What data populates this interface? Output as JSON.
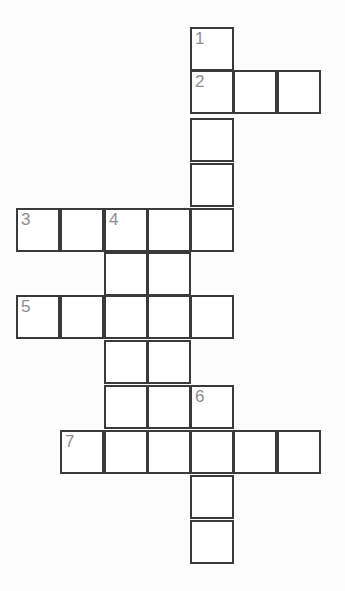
{
  "puzzle": {
    "type": "crossword-grid",
    "title": "Crossword puzzle grid",
    "background_color": "#fdfdfd",
    "cell_fill_color": "#ffffff",
    "cell_border_color": "#3a3a3a",
    "number_color": "#8d8d8d",
    "cell_size": 44,
    "columns": 7,
    "rows": 12,
    "clue_numbers": [
      "1",
      "2",
      "3",
      "4",
      "5",
      "6",
      "7"
    ],
    "cells": [
      {
        "name": "cell-c4-r0",
        "col": 4,
        "row": 0,
        "number": "1"
      },
      {
        "name": "cell-c4-r1",
        "col": 4,
        "row": 1,
        "number": "2"
      },
      {
        "name": "cell-c5-r1",
        "col": 5,
        "row": 1,
        "number": ""
      },
      {
        "name": "cell-c6-r1",
        "col": 6,
        "row": 1,
        "number": ""
      },
      {
        "name": "cell-c4-r2",
        "col": 4,
        "row": 2,
        "number": ""
      },
      {
        "name": "cell-c4-r3",
        "col": 4,
        "row": 3,
        "number": ""
      },
      {
        "name": "cell-c0-r4",
        "col": 0,
        "row": 4,
        "number": "3"
      },
      {
        "name": "cell-c1-r4",
        "col": 1,
        "row": 4,
        "number": ""
      },
      {
        "name": "cell-c2-r4",
        "col": 2,
        "row": 4,
        "number": "4"
      },
      {
        "name": "cell-c3-r4",
        "col": 3,
        "row": 4,
        "number": ""
      },
      {
        "name": "cell-c4-r4",
        "col": 4,
        "row": 4,
        "number": ""
      },
      {
        "name": "cell-c2-r5",
        "col": 2,
        "row": 5,
        "number": ""
      },
      {
        "name": "cell-c3-r5",
        "col": 3,
        "row": 5,
        "number": ""
      },
      {
        "name": "cell-c0-r6",
        "col": 0,
        "row": 6,
        "number": "5"
      },
      {
        "name": "cell-c1-r6",
        "col": 1,
        "row": 6,
        "number": ""
      },
      {
        "name": "cell-c2-r6",
        "col": 2,
        "row": 6,
        "number": ""
      },
      {
        "name": "cell-c3-r6",
        "col": 3,
        "row": 6,
        "number": ""
      },
      {
        "name": "cell-c4-r6",
        "col": 4,
        "row": 6,
        "number": ""
      },
      {
        "name": "cell-c2-r7",
        "col": 2,
        "row": 7,
        "number": ""
      },
      {
        "name": "cell-c3-r7",
        "col": 3,
        "row": 7,
        "number": ""
      },
      {
        "name": "cell-c2-r8",
        "col": 2,
        "row": 8,
        "number": ""
      },
      {
        "name": "cell-c3-r8",
        "col": 3,
        "row": 8,
        "number": ""
      },
      {
        "name": "cell-c4-r8",
        "col": 4,
        "row": 8,
        "number": "6"
      },
      {
        "name": "cell-c1-r9",
        "col": 1,
        "row": 9,
        "number": "7"
      },
      {
        "name": "cell-c2-r9",
        "col": 2,
        "row": 9,
        "number": ""
      },
      {
        "name": "cell-c3-r9",
        "col": 3,
        "row": 9,
        "number": ""
      },
      {
        "name": "cell-c4-r9",
        "col": 4,
        "row": 9,
        "number": ""
      },
      {
        "name": "cell-c5-r9",
        "col": 5,
        "row": 9,
        "number": ""
      },
      {
        "name": "cell-c6-r9",
        "col": 6,
        "row": 9,
        "number": ""
      },
      {
        "name": "cell-c4-r10",
        "col": 4,
        "row": 10,
        "number": ""
      },
      {
        "name": "cell-c4-r11",
        "col": 4,
        "row": 11,
        "number": ""
      }
    ]
  }
}
